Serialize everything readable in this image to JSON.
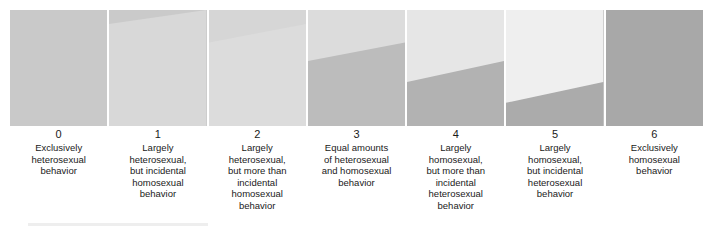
{
  "figure": {
    "name": "Kinsey Scale",
    "panel_count": 7,
    "colors": {
      "heterosexual_light": "#dedede",
      "homosexual_dark": "#a8a8a8",
      "panel_gap": "#ffffff",
      "background": "#ffffff",
      "text": "#1a1a1a"
    }
  },
  "scale": {
    "items": [
      {
        "number": "0",
        "text": "Exclusively\nheterosexual\nbehavior",
        "light_fraction_left": 1.0,
        "light_fraction_right": 1.0,
        "fill_light": "#c9c9c9",
        "fill_dark": "#c9c9c9"
      },
      {
        "number": "1",
        "text": "Largely\nheterosexual,\nbut incidental\nhomosexual\nbehavior",
        "light_fraction_left": 0.88,
        "light_fraction_right": 1.0,
        "fill_light": "#cacaca",
        "fill_dark": "#d8d8d8"
      },
      {
        "number": "2",
        "text": "Largely\nheterosexual,\nbut more than\nincidental\nhomosexual\nbehavior",
        "light_fraction_left": 0.72,
        "light_fraction_right": 0.88,
        "fill_light": "#d6d6d6",
        "fill_dark": "#dcdcdc"
      },
      {
        "number": "3",
        "text": "Equal amounts\nof heterosexual\nand homosexual\nbehavior",
        "light_fraction_left": 0.56,
        "light_fraction_right": 0.72,
        "fill_light": "#dcdcdc",
        "fill_dark": "#bcbcbc"
      },
      {
        "number": "4",
        "text": "Largely\nhomosexual,\nbut more than\nincidental\nheterosexual\nbehavior",
        "light_fraction_left": 0.38,
        "light_fraction_right": 0.56,
        "fill_light": "#e6e6e6",
        "fill_dark": "#b2b2b2"
      },
      {
        "number": "5",
        "text": "Largely\nhomosexual,\nbut incidental\nheterosexual\nbehavior",
        "light_fraction_left": 0.2,
        "light_fraction_right": 0.38,
        "fill_light": "#efefef",
        "fill_dark": "#ababab"
      },
      {
        "number": "6",
        "text": "Exclusively\nhomosexual\nbehavior",
        "light_fraction_left": 0.0,
        "light_fraction_right": 0.0,
        "fill_light": "#a8a8a8",
        "fill_dark": "#a8a8a8"
      }
    ]
  }
}
